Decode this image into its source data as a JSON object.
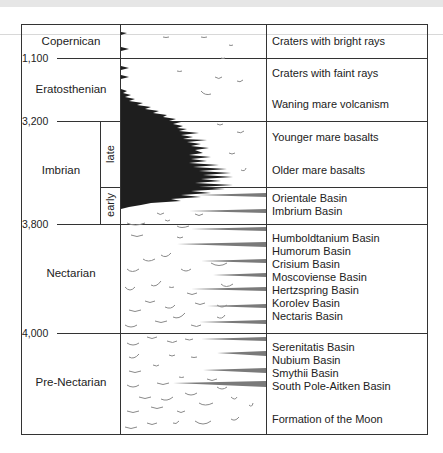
{
  "diagram": {
    "title": "",
    "periods": [
      {
        "name": "Copernican",
        "events": [
          "Craters with bright rays"
        ]
      },
      {
        "name": "Eratosthenian",
        "events": [
          "Craters with faint rays",
          "Waning mare volcanism"
        ]
      },
      {
        "name": "Imbrian",
        "subdivisions": [
          {
            "name": "late",
            "events": [
              "Younger mare basalts",
              "Older mare basalts"
            ]
          },
          {
            "name": "early",
            "events": [
              "Orientale Basin",
              "Imbrium Basin"
            ]
          }
        ]
      },
      {
        "name": "Nectarian",
        "events": [
          "Humboldtanium Basin",
          "Humorum Basin",
          "Crisium Basin",
          "Moscoviense Basin",
          "Hertzspring Basin",
          "Korolev Basin",
          "Nectaris Basin"
        ]
      },
      {
        "name": "Pre-Nectarian",
        "events": [
          "Serenitatis Basin",
          "Nubium Basin",
          "Smythii Basin",
          "South Pole-Aitken Basin",
          "Formation of the Moon"
        ]
      }
    ],
    "boundaries": [
      "1,100",
      "3,200",
      "3,800",
      "4,000"
    ],
    "colors": {
      "mare_basalt_fill": "#1e1e1e",
      "basin_streak": "#7a7a7a",
      "crater_arc": "#8a8a8a",
      "grid_line": "#333333"
    }
  }
}
